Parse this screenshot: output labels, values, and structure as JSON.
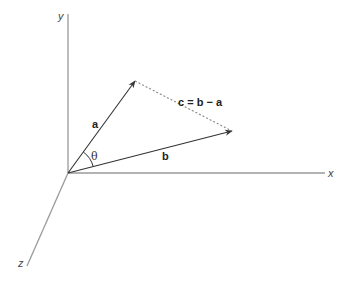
{
  "diagram": {
    "colors": {
      "axis": "#9a9a9a",
      "vector": "#333333",
      "dotted": "#888888",
      "text": "#222222"
    },
    "origin": [
      68,
      173
    ],
    "axes": {
      "x": {
        "label": "x",
        "end": [
          325,
          173
        ],
        "label_pos": [
          328,
          177
        ]
      },
      "y": {
        "label": "y",
        "end": [
          68,
          14
        ],
        "label_pos": [
          58,
          20
        ]
      },
      "z": {
        "label": "z",
        "end": [
          27,
          266
        ],
        "label_pos": [
          18,
          267
        ]
      }
    },
    "vectors": {
      "a": {
        "label": "a",
        "tip": [
          135,
          81
        ],
        "label_pos": [
          92,
          128
        ]
      },
      "b": {
        "label": "b",
        "tip": [
          232,
          131
        ],
        "label_pos": [
          162,
          160
        ]
      },
      "c": {
        "label": "c = b − a",
        "from": [
          135,
          81
        ],
        "to": [
          232,
          131
        ],
        "style": "dotted",
        "label_pos": [
          178,
          106
        ]
      }
    },
    "angle": {
      "label": "θ",
      "label_pos": [
        91,
        160
      ],
      "radius": 26
    }
  }
}
